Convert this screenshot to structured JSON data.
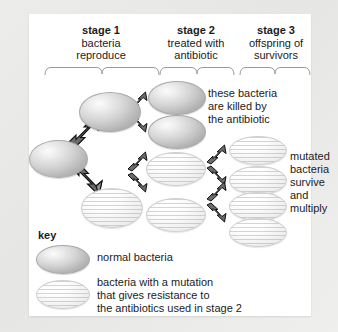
{
  "diagram": {
    "title_visible": false,
    "stages": [
      {
        "id": "stage1",
        "label": "stage 1",
        "desc_line1": "bacteria",
        "desc_line2": "reproduce"
      },
      {
        "id": "stage2",
        "label": "stage 2",
        "desc_line1": "treated with",
        "desc_line2": "antibiotic"
      },
      {
        "id": "stage3",
        "label": "stage 3",
        "desc_line1": "offspring of",
        "desc_line2": "survivors"
      }
    ],
    "annotations": [
      {
        "id": "killed",
        "lines": [
          "these bacteria",
          "are killed by",
          "the antibiotic"
        ]
      },
      {
        "id": "survive",
        "lines": [
          "mutated",
          "bacteria",
          "survive",
          "and",
          "multiply"
        ]
      }
    ],
    "key": {
      "title": "key",
      "entries": [
        {
          "swatch": "normal",
          "lines": [
            "normal bacteria"
          ]
        },
        {
          "swatch": "mutant",
          "lines": [
            "bacteria with a mutation",
            "that gives resistance to",
            "the antibiotics used in stage 2"
          ]
        }
      ]
    },
    "cells": [
      {
        "id": "parent",
        "type": "normal",
        "stage": 1
      },
      {
        "id": "gen2-upper",
        "type": "normal",
        "stage": 1
      },
      {
        "id": "gen2-lower",
        "type": "mutant",
        "stage": 1
      },
      {
        "id": "s2-n1",
        "type": "normal",
        "stage": 2
      },
      {
        "id": "s2-n2",
        "type": "normal",
        "stage": 2
      },
      {
        "id": "s2-m1",
        "type": "mutant",
        "stage": 2
      },
      {
        "id": "s2-m2",
        "type": "mutant",
        "stage": 2
      },
      {
        "id": "s3-m1",
        "type": "mutant",
        "stage": 3
      },
      {
        "id": "s3-m2",
        "type": "mutant",
        "stage": 3
      },
      {
        "id": "s3-m3",
        "type": "mutant",
        "stage": 3
      },
      {
        "id": "s3-m4",
        "type": "mutant",
        "stage": 3
      }
    ],
    "colors": {
      "page_background": "#e9e9e9",
      "card_background": "#ffffff",
      "text": "#1b1b1b",
      "normal_bacteria_fill": "#bdbdbd",
      "mutant_bacteria_fill": "#f2f2f2",
      "arrow_fill": "#6f6f6f",
      "arrow_edge": "#111111",
      "bracket_line": "#9a9a9a"
    }
  }
}
